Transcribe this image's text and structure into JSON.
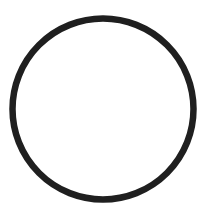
{
  "canvas": {
    "width": 212,
    "height": 215,
    "background": "#ffffff"
  },
  "shapes": [
    {
      "type": "circle",
      "cx": 103,
      "cy": 109,
      "r": 90.5,
      "stroke": "#1f1f1f",
      "stroke_width": 6.5,
      "fill": "none"
    }
  ]
}
